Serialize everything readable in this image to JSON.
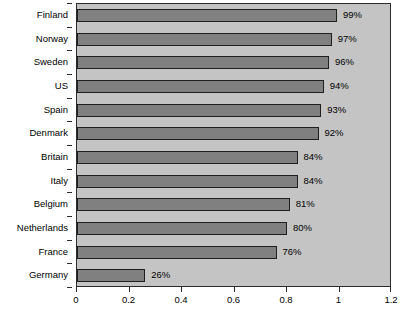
{
  "chart_data": {
    "type": "bar",
    "orientation": "horizontal",
    "title": "",
    "subtitle": "",
    "xlabel": "",
    "ylabel": "",
    "xlim": [
      0,
      1.2
    ],
    "xticks": [
      "0",
      "0.2",
      "0.4",
      "0.6",
      "0.8",
      "1",
      "1.2"
    ],
    "xtick_values": [
      0,
      0.2,
      0.4,
      0.6,
      0.8,
      1,
      1.2
    ],
    "grid": false,
    "legend": null,
    "categories": [
      "Finland",
      "Norway",
      "Sweden",
      "US",
      "Spain",
      "Denmark",
      "Britain",
      "Italy",
      "Belgium",
      "Netherlands",
      "France",
      "Germany"
    ],
    "values": [
      0.99,
      0.97,
      0.96,
      0.94,
      0.93,
      0.92,
      0.84,
      0.84,
      0.81,
      0.8,
      0.76,
      0.26
    ],
    "data_labels": [
      "99%",
      "97%",
      "96%",
      "94%",
      "93%",
      "92%",
      "84%",
      "84%",
      "81%",
      "80%",
      "76%",
      "26%"
    ],
    "colors": {
      "bar_fill": "#808080",
      "bar_border": "#1f1f1f",
      "plot_background": "#c4c4c4",
      "plot_border": "#2b2b2b",
      "page_background": "#ffffff",
      "text": "#000000"
    }
  }
}
